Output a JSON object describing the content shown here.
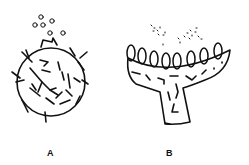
{
  "diagram": {
    "panels": [
      {
        "id": "A",
        "label": "A",
        "description": "spherical body with branching internal hyphae and short external bristles, with small circular spores escaping from a neck opening at top"
      },
      {
        "id": "B",
        "label": "B",
        "description": "cup-shaped fruiting body on a stalk with a row of oval sacs along the rim, fine spores dispersing above"
      }
    ],
    "colors": {
      "ink": "#111111",
      "background": "#ffffff"
    }
  }
}
